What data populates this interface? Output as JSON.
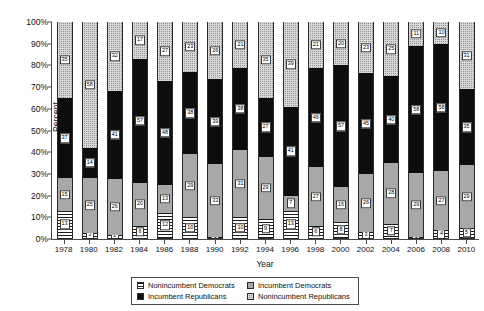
{
  "chart_data": {
    "type": "bar",
    "stacked": true,
    "normalized_percent": true,
    "title": "",
    "xlabel": "Year",
    "ylabel": "Percent",
    "ylim": [
      0,
      100
    ],
    "ytick_labels": [
      "0%",
      "10%",
      "20%",
      "30%",
      "40%",
      "50%",
      "60%",
      "70%",
      "80%",
      "90%",
      "100%"
    ],
    "ytick_values": [
      0,
      10,
      20,
      30,
      40,
      50,
      60,
      70,
      80,
      90,
      100
    ],
    "grid": false,
    "legend_position": "bottom",
    "categories": [
      "1978",
      "1980",
      "1982",
      "1984",
      "1986",
      "1988",
      "1990",
      "1992",
      "1994",
      "1996",
      "1998",
      "2000",
      "2002",
      "2004",
      "2006",
      "2008",
      "2010"
    ],
    "series": [
      {
        "name": "Nonincumbent Democrats",
        "pattern": "horizontal-stripes",
        "values": [
          13,
          3,
          2,
          6,
          12,
          10,
          1,
          10,
          9,
          13,
          6,
          8,
          3,
          7,
          1,
          4,
          5
        ]
      },
      {
        "name": "Incumbent Democrats",
        "pattern": "light-gray-solid",
        "values": [
          15,
          25,
          26,
          20,
          13,
          29,
          33,
          31,
          29,
          7,
          27,
          16,
          26,
          28,
          29,
          27,
          29
        ]
      },
      {
        "name": "Incumbent Republicans",
        "pattern": "black-solid",
        "values": [
          37,
          14,
          41,
          57,
          48,
          38,
          39,
          38,
          27,
          41,
          46,
          57,
          45,
          40,
          58,
          58,
          35
        ]
      },
      {
        "name": "Nonincumbent Republicans",
        "pattern": "checkered-gray",
        "values": [
          35,
          58,
          32,
          17,
          27,
          23,
          26,
          21,
          35,
          39,
          21,
          20,
          23,
          25,
          11,
          10,
          31
        ]
      }
    ]
  },
  "legend": {
    "items": [
      {
        "label": "Nonincumbent Democrats",
        "pattern": "horizontal-stripes"
      },
      {
        "label": "Incumbent Democrats",
        "pattern": "light-gray-solid"
      },
      {
        "label": "Incumbent Republicans",
        "pattern": "black-solid"
      },
      {
        "label": "Nonincumbent Republicans",
        "pattern": "checkered-gray"
      }
    ]
  },
  "colors": {
    "axis": "#4a4a4a",
    "incumbent_democrats": "#a8a8a8",
    "incumbent_republicans": "#0d0d0d",
    "nonincumbent_republicans": "#8f8f8f",
    "background": "#ffffff"
  }
}
